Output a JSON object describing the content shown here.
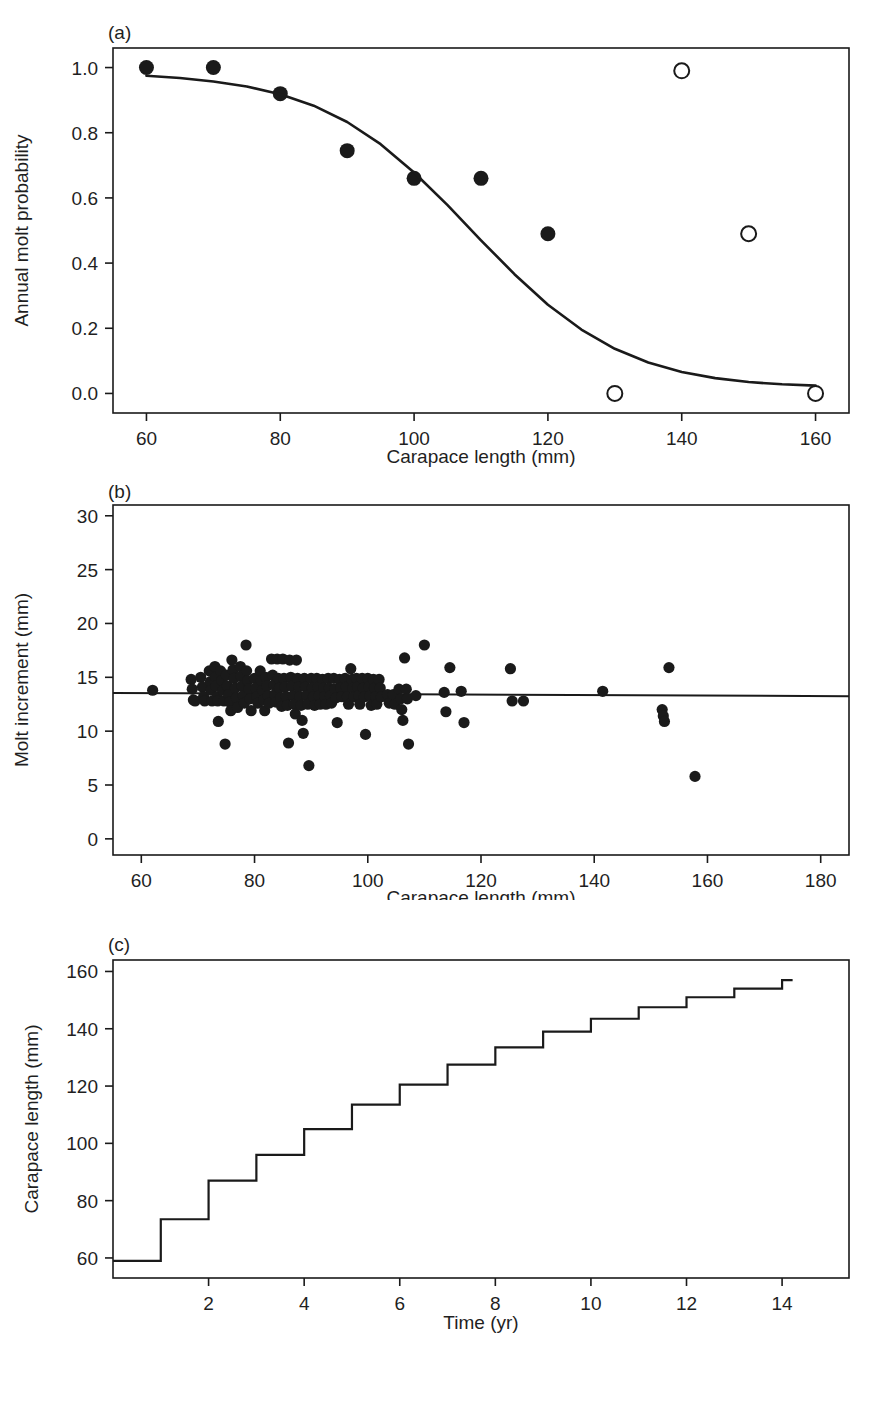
{
  "figure": {
    "background_color": "#ffffff",
    "ink_color": "#1a1a1a",
    "panels": [
      {
        "tag": "(a)"
      },
      {
        "tag": "(b)"
      },
      {
        "tag": "(c)"
      }
    ]
  },
  "chart_data": [
    {
      "panel": "(a)",
      "type": "scatter",
      "title": "",
      "xlabel": "Carapace length (mm)",
      "ylabel": "Annual molt probability",
      "xlim": [
        55,
        165
      ],
      "ylim": [
        -0.06,
        1.06
      ],
      "xticks": [
        60,
        80,
        100,
        120,
        140,
        160
      ],
      "xticklabels": [
        "60",
        "80",
        "100",
        "120",
        "140",
        "160"
      ],
      "yticks": [
        0.0,
        0.2,
        0.4,
        0.6,
        0.8,
        1.0
      ],
      "yticklabels": [
        "0.0",
        "0.2",
        "0.4",
        "0.6",
        "0.8",
        "1.0"
      ],
      "grid": false,
      "legend": "none",
      "series": [
        {
          "name": "observed (filled circles)",
          "marker": "filled-circle",
          "x": [
            60,
            70,
            80,
            90,
            100,
            110,
            120
          ],
          "y": [
            1.0,
            1.0,
            0.92,
            0.745,
            0.66,
            0.66,
            0.49
          ]
        },
        {
          "name": "extrapolated (open circles)",
          "marker": "open-circle",
          "x": [
            130,
            140,
            150,
            160
          ],
          "y": [
            0.0,
            0.99,
            0.49,
            0.0
          ]
        },
        {
          "name": "fitted logistic curve",
          "marker": "line",
          "x": [
            60,
            65,
            70,
            75,
            80,
            85,
            90,
            95,
            100,
            105,
            110,
            115,
            120,
            125,
            130,
            135,
            140,
            145,
            150,
            155,
            160
          ],
          "y": [
            0.975,
            0.968,
            0.957,
            0.942,
            0.918,
            0.883,
            0.833,
            0.765,
            0.678,
            0.578,
            0.47,
            0.366,
            0.272,
            0.196,
            0.137,
            0.095,
            0.066,
            0.047,
            0.035,
            0.028,
            0.024
          ]
        }
      ]
    },
    {
      "panel": "(b)",
      "type": "scatter",
      "title": "",
      "xlabel": "Carapace length (mm)",
      "ylabel": "Molt increment (mm)",
      "xlim": [
        55,
        185
      ],
      "ylim": [
        -1.5,
        31.0
      ],
      "xticks": [
        60,
        80,
        100,
        120,
        140,
        160,
        180
      ],
      "xticklabels": [
        "60",
        "80",
        "100",
        "120",
        "140",
        "160",
        "180"
      ],
      "yticks": [
        0,
        5,
        10,
        15,
        20,
        25,
        30
      ],
      "yticklabels": [
        "0",
        "5",
        "10",
        "15",
        "20",
        "25",
        "30"
      ],
      "grid": false,
      "legend": "none",
      "regression_line": {
        "name": "fitted mean increment",
        "x": [
          55,
          185
        ],
        "y": [
          13.55,
          13.25
        ]
      },
      "series": [
        {
          "name": "molt increment observations",
          "marker": "filled-circle",
          "points": [
            [
              62.0,
              13.8
            ],
            [
              68.8,
              14.8
            ],
            [
              69.0,
              13.9
            ],
            [
              69.2,
              12.9
            ],
            [
              69.5,
              12.8
            ],
            [
              70.5,
              15.0
            ],
            [
              70.8,
              14.1
            ],
            [
              71.0,
              13.2
            ],
            [
              71.2,
              12.8
            ],
            [
              72.0,
              15.6
            ],
            [
              72.2,
              14.6
            ],
            [
              72.3,
              13.8
            ],
            [
              72.5,
              12.8
            ],
            [
              73.0,
              16.0
            ],
            [
              73.1,
              15.0
            ],
            [
              73.2,
              14.2
            ],
            [
              73.4,
              13.2
            ],
            [
              73.5,
              12.8
            ],
            [
              73.6,
              10.9
            ],
            [
              74.0,
              15.6
            ],
            [
              74.2,
              14.7
            ],
            [
              74.4,
              13.8
            ],
            [
              74.6,
              12.8
            ],
            [
              74.8,
              8.8
            ],
            [
              75.0,
              15.2
            ],
            [
              75.2,
              14.2
            ],
            [
              75.4,
              13.4
            ],
            [
              75.6,
              12.7
            ],
            [
              75.8,
              11.9
            ],
            [
              76.0,
              16.6
            ],
            [
              76.2,
              15.7
            ],
            [
              76.4,
              14.9
            ],
            [
              76.6,
              14.0
            ],
            [
              76.8,
              13.1
            ],
            [
              77.0,
              12.2
            ],
            [
              77.5,
              16.0
            ],
            [
              77.6,
              15.1
            ],
            [
              77.8,
              14.2
            ],
            [
              78.0,
              13.3
            ],
            [
              78.2,
              12.6
            ],
            [
              78.5,
              18.0
            ],
            [
              78.6,
              15.6
            ],
            [
              78.8,
              14.7
            ],
            [
              79.0,
              13.9
            ],
            [
              79.2,
              13.0
            ],
            [
              79.4,
              11.9
            ],
            [
              80.0,
              14.9
            ],
            [
              80.2,
              14.0
            ],
            [
              80.4,
              13.2
            ],
            [
              80.6,
              12.6
            ],
            [
              81.0,
              15.6
            ],
            [
              81.2,
              14.7
            ],
            [
              81.4,
              13.8
            ],
            [
              81.6,
              12.9
            ],
            [
              81.8,
              11.9
            ],
            [
              82.0,
              15.0
            ],
            [
              82.2,
              14.2
            ],
            [
              82.4,
              13.3
            ],
            [
              82.6,
              12.6
            ],
            [
              83.0,
              16.7
            ],
            [
              83.2,
              15.2
            ],
            [
              83.4,
              14.3
            ],
            [
              83.6,
              13.4
            ],
            [
              83.8,
              12.7
            ],
            [
              84.0,
              16.7
            ],
            [
              84.2,
              14.9
            ],
            [
              84.4,
              14.0
            ],
            [
              84.6,
              13.1
            ],
            [
              84.8,
              12.3
            ],
            [
              85.0,
              16.7
            ],
            [
              85.2,
              14.9
            ],
            [
              85.4,
              14.1
            ],
            [
              85.6,
              13.2
            ],
            [
              85.8,
              12.4
            ],
            [
              86.0,
              8.9
            ],
            [
              86.2,
              16.6
            ],
            [
              86.4,
              15.0
            ],
            [
              86.6,
              14.2
            ],
            [
              86.8,
              13.3
            ],
            [
              87.0,
              12.5
            ],
            [
              87.2,
              11.6
            ],
            [
              87.4,
              16.6
            ],
            [
              87.6,
              14.9
            ],
            [
              87.8,
              14.1
            ],
            [
              88.0,
              13.2
            ],
            [
              88.2,
              12.4
            ],
            [
              88.4,
              11.0
            ],
            [
              88.6,
              9.8
            ],
            [
              88.8,
              14.9
            ],
            [
              89.0,
              14.1
            ],
            [
              89.2,
              13.3
            ],
            [
              89.4,
              12.5
            ],
            [
              89.6,
              6.8
            ],
            [
              90.0,
              14.9
            ],
            [
              90.2,
              14.0
            ],
            [
              90.4,
              13.2
            ],
            [
              90.6,
              12.4
            ],
            [
              91.0,
              14.9
            ],
            [
              91.2,
              14.1
            ],
            [
              91.4,
              13.3
            ],
            [
              91.6,
              12.5
            ],
            [
              92.0,
              14.8
            ],
            [
              92.2,
              14.0
            ],
            [
              92.4,
              13.2
            ],
            [
              92.6,
              12.5
            ],
            [
              93.0,
              14.9
            ],
            [
              93.2,
              14.0
            ],
            [
              93.4,
              13.3
            ],
            [
              93.6,
              12.6
            ],
            [
              94.0,
              14.9
            ],
            [
              94.2,
              13.9
            ],
            [
              94.4,
              13.1
            ],
            [
              94.6,
              10.8
            ],
            [
              95.0,
              14.8
            ],
            [
              95.2,
              14.0
            ],
            [
              95.4,
              13.2
            ],
            [
              96.0,
              14.9
            ],
            [
              96.2,
              14.1
            ],
            [
              96.4,
              13.2
            ],
            [
              96.6,
              12.5
            ],
            [
              97.0,
              15.8
            ],
            [
              97.2,
              14.8
            ],
            [
              97.4,
              14.0
            ],
            [
              97.6,
              13.2
            ],
            [
              98.0,
              14.9
            ],
            [
              98.2,
              14.1
            ],
            [
              98.4,
              13.3
            ],
            [
              98.6,
              12.5
            ],
            [
              99.0,
              14.9
            ],
            [
              99.2,
              14.0
            ],
            [
              99.4,
              13.2
            ],
            [
              99.6,
              9.7
            ],
            [
              100.0,
              14.9
            ],
            [
              100.2,
              14.1
            ],
            [
              100.4,
              13.3
            ],
            [
              100.6,
              12.4
            ],
            [
              101.0,
              14.8
            ],
            [
              101.2,
              14.0
            ],
            [
              101.4,
              13.2
            ],
            [
              101.6,
              12.5
            ],
            [
              102.0,
              14.8
            ],
            [
              102.2,
              14.0
            ],
            [
              102.4,
              13.2
            ],
            [
              103.5,
              13.4
            ],
            [
              103.8,
              12.6
            ],
            [
              104.5,
              13.4
            ],
            [
              104.8,
              12.5
            ],
            [
              105.5,
              13.9
            ],
            [
              105.8,
              13.0
            ],
            [
              106.0,
              12.0
            ],
            [
              106.2,
              11.0
            ],
            [
              106.5,
              16.8
            ],
            [
              106.8,
              13.9
            ],
            [
              107.0,
              13.0
            ],
            [
              107.2,
              8.8
            ],
            [
              108.5,
              13.3
            ],
            [
              110.0,
              18.0
            ],
            [
              113.5,
              13.6
            ],
            [
              113.8,
              11.8
            ],
            [
              114.5,
              15.9
            ],
            [
              116.5,
              13.7
            ],
            [
              117.0,
              10.8
            ],
            [
              125.2,
              15.8
            ],
            [
              125.5,
              12.8
            ],
            [
              127.5,
              12.8
            ],
            [
              141.5,
              13.7
            ],
            [
              152.0,
              12.0
            ],
            [
              152.2,
              11.4
            ],
            [
              152.4,
              10.9
            ],
            [
              153.2,
              15.9
            ],
            [
              157.8,
              5.8
            ]
          ]
        }
      ]
    },
    {
      "panel": "(c)",
      "type": "line",
      "subtype": "step",
      "title": "",
      "xlabel": "Time (yr)",
      "ylabel": "Carapace length (mm)",
      "xlim": [
        0,
        15.4
      ],
      "ylim": [
        53,
        164
      ],
      "xticks": [
        2,
        4,
        6,
        8,
        10,
        12,
        14
      ],
      "xticklabels": [
        "2",
        "4",
        "6",
        "8",
        "10",
        "12",
        "14"
      ],
      "yticks": [
        60,
        80,
        100,
        120,
        140,
        160
      ],
      "yticklabels": [
        "60",
        "80",
        "100",
        "120",
        "140",
        "160"
      ],
      "grid": false,
      "legend": "none",
      "series": [
        {
          "name": "predicted growth trajectory",
          "marker": "step-line",
          "x": [
            0,
            1,
            2,
            3,
            4,
            5,
            6,
            7,
            8,
            9,
            10,
            11,
            12,
            13,
            14
          ],
          "y": [
            59,
            73.5,
            87,
            96,
            105,
            113.5,
            120.5,
            127.5,
            133.5,
            139,
            143.5,
            147.5,
            151,
            154,
            157
          ]
        }
      ]
    }
  ]
}
